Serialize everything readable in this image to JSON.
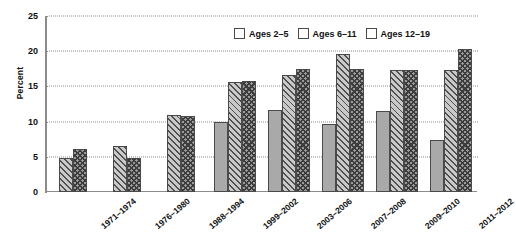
{
  "chart_data": {
    "type": "bar",
    "title": "",
    "xlabel": "",
    "ylabel": "Percent",
    "ylim": [
      0,
      25
    ],
    "yticks": [
      0,
      5,
      10,
      15,
      20,
      25
    ],
    "grid": true,
    "legend_position": "top-right",
    "categories": [
      "1971–1974",
      "1976–1980",
      "1988–1994",
      "1999–2002",
      "2003–2006",
      "2007–2008",
      "2009–2010",
      "2011–2012"
    ],
    "series": [
      {
        "name": "Ages 2–5",
        "pattern": "solid",
        "color": "#a9a9a9",
        "values": [
          null,
          null,
          null,
          9.9,
          11.6,
          9.7,
          11.5,
          7.4
        ]
      },
      {
        "name": "Ages 6–11",
        "pattern": "diagonal",
        "color": "#c9c9c9",
        "values": [
          4.9,
          6.5,
          10.9,
          15.6,
          16.6,
          19.6,
          17.4,
          17.3
        ]
      },
      {
        "name": "Ages 12–19",
        "pattern": "cross",
        "color": "#9a9a9a",
        "values": [
          6.1,
          4.9,
          10.8,
          15.7,
          17.5,
          17.5,
          17.4,
          20.3
        ]
      }
    ]
  },
  "axis": {
    "y_title": "Percent",
    "tick_labels": [
      "0",
      "5",
      "10",
      "15",
      "20",
      "25"
    ]
  },
  "legend": {
    "items": [
      {
        "label": "Ages 2–5"
      },
      {
        "label": "Ages 6–11"
      },
      {
        "label": "Ages 12–19"
      }
    ]
  }
}
